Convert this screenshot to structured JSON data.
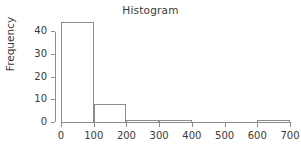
{
  "chart_data": {
    "type": "bar",
    "title": "Histogram",
    "xlabel": "",
    "ylabel": "Frequency",
    "bin_width": 100,
    "bin_edges": [
      0,
      100,
      200,
      300,
      400,
      500,
      600,
      700
    ],
    "categories": [
      "0-100",
      "100-200",
      "200-300",
      "300-400",
      "400-500",
      "500-600",
      "600-700"
    ],
    "values": [
      44,
      8,
      1,
      1,
      0,
      0,
      1
    ],
    "xlim": [
      0,
      700
    ],
    "ylim": [
      0,
      45
    ],
    "xticks": [
      0,
      100,
      200,
      300,
      400,
      500,
      600,
      700
    ],
    "xtick_labels": [
      "0",
      "100",
      "200",
      "300",
      "400",
      "500",
      "600",
      "700"
    ],
    "yticks": [
      0,
      10,
      20,
      30,
      40
    ],
    "ytick_labels": [
      "0",
      "10",
      "20",
      "30",
      "40"
    ],
    "grid": false,
    "legend": false,
    "bar_fill": "#ffffff",
    "bar_border": "#8d8d8d",
    "axis_color": "#8d8d8d",
    "text_color": "#3a3a3a",
    "background": "#ffffff"
  }
}
